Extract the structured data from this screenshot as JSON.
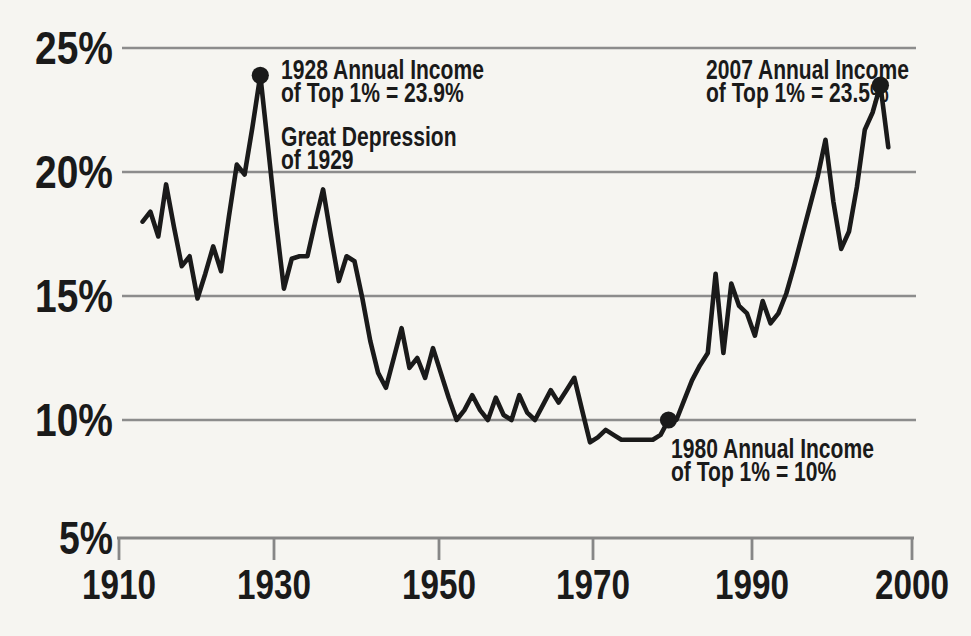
{
  "figure": {
    "background": "#f6f5f1",
    "line_color": "#1a1a1a",
    "grid_color": "#8c8c8c",
    "text_color": "#1a1a1a"
  },
  "annotations": [
    {
      "id": "peak-1928",
      "lines": [
        "1928 Annual Income",
        "of Top 1% = 23.9%"
      ]
    },
    {
      "id": "depression",
      "lines": [
        "Great Depression",
        "of 1929"
      ]
    },
    {
      "id": "peak-2007",
      "lines": [
        "2007 Annual Income",
        "of Top 1% = 23.5%"
      ]
    },
    {
      "id": "low-1980",
      "lines": [
        "1980 Annual Income",
        "of Top 1% = 10%"
      ]
    }
  ],
  "chart_data": {
    "type": "line",
    "series_name": "Annual income share of Top 1%",
    "xlabel": "",
    "ylabel": "",
    "xticks": [
      "1910",
      "1930",
      "1950",
      "1970",
      "1990",
      "2000"
    ],
    "yticks": [
      "25%",
      "20%",
      "15%",
      "10%",
      "5%"
    ],
    "xlim": [
      1910,
      2010
    ],
    "ylim": [
      5,
      25
    ],
    "grid": "horizontal",
    "legend": "none",
    "x": [
      1913,
      1914,
      1915,
      1916,
      1917,
      1918,
      1919,
      1920,
      1921,
      1922,
      1923,
      1924,
      1925,
      1926,
      1927,
      1928,
      1929,
      1930,
      1931,
      1932,
      1933,
      1934,
      1935,
      1936,
      1937,
      1938,
      1939,
      1940,
      1941,
      1942,
      1943,
      1944,
      1945,
      1946,
      1947,
      1948,
      1949,
      1950,
      1951,
      1952,
      1953,
      1954,
      1955,
      1956,
      1957,
      1958,
      1959,
      1960,
      1961,
      1962,
      1963,
      1964,
      1965,
      1966,
      1967,
      1968,
      1969,
      1970,
      1971,
      1972,
      1973,
      1974,
      1975,
      1976,
      1977,
      1978,
      1979,
      1980,
      1981,
      1982,
      1983,
      1984,
      1985,
      1986,
      1987,
      1988,
      1989,
      1990,
      1991,
      1992,
      1993,
      1994,
      1995,
      1996,
      1997,
      1998,
      1999,
      2000,
      2001,
      2002,
      2003,
      2004,
      2005,
      2006,
      2007,
      2008
    ],
    "values": [
      18.0,
      18.4,
      17.4,
      19.5,
      17.8,
      16.2,
      16.6,
      14.9,
      15.9,
      17.0,
      16.0,
      18.2,
      20.3,
      19.9,
      21.8,
      23.9,
      21.0,
      18.0,
      15.3,
      16.5,
      16.6,
      16.6,
      18.0,
      19.3,
      17.4,
      15.6,
      16.6,
      16.4,
      14.9,
      13.2,
      11.9,
      11.3,
      12.5,
      13.7,
      12.1,
      12.5,
      11.7,
      12.9,
      11.9,
      10.9,
      10.0,
      10.4,
      11.0,
      10.4,
      10.0,
      10.9,
      10.2,
      10.0,
      11.0,
      10.3,
      10.0,
      10.6,
      11.2,
      10.7,
      11.2,
      11.7,
      10.4,
      9.1,
      9.3,
      9.6,
      9.4,
      9.2,
      9.2,
      9.2,
      9.2,
      9.2,
      9.4,
      10.0,
      10.0,
      10.8,
      11.6,
      12.2,
      12.7,
      15.9,
      12.7,
      15.5,
      14.6,
      14.3,
      13.4,
      14.8,
      13.9,
      14.3,
      15.1,
      16.2,
      17.4,
      18.6,
      19.8,
      21.3,
      18.8,
      16.9,
      17.6,
      19.4,
      21.7,
      22.4,
      23.5,
      21.0
    ],
    "markers": [
      {
        "year": 1928,
        "value": 23.9
      },
      {
        "year": 1980,
        "value": 10
      },
      {
        "year": 2007,
        "value": 23.5
      }
    ]
  }
}
